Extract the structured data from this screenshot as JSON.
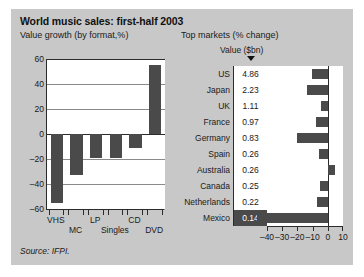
{
  "figure": {
    "title": "World music sales: first-half 2003",
    "subtitle_left": "Value growth (by format,%)",
    "subtitle_right": "Top markets (% change)",
    "value_column_header": "Value ($bn)",
    "sort_marker_icon": "sort-descending-triangle-icon",
    "source": "Source: IFPI."
  },
  "chart_data": [
    {
      "type": "bar",
      "title": "Value growth (by format,%)",
      "xlabel": "",
      "ylabel": "",
      "ylim": [
        -60,
        60
      ],
      "yticks": [
        -60,
        -40,
        -20,
        0,
        20,
        40,
        60
      ],
      "ytick_labels": [
        "–60",
        "–40",
        "–20",
        "0",
        "20",
        "40",
        "60"
      ],
      "grid": true,
      "legend": "none",
      "categories": [
        "VHS",
        "MC",
        "LP",
        "Singles",
        "CD",
        "DVD"
      ],
      "values": [
        -55,
        -33,
        -19,
        -19,
        -11,
        55
      ],
      "bar_color": "#4a4a4a"
    },
    {
      "type": "bar",
      "orientation": "horizontal",
      "title": "Top markets (% change)",
      "xlabel": "",
      "ylabel": "",
      "xlim": [
        -40,
        10
      ],
      "xticks": [
        -40,
        -30,
        -20,
        -10,
        0,
        10
      ],
      "xtick_labels": [
        "–40",
        "–30",
        "–20",
        "–10",
        "0",
        "10"
      ],
      "grid": false,
      "legend": "none",
      "value_column_label": "Value ($bn)",
      "categories": [
        "US",
        "Japan",
        "UK",
        "France",
        "Germany",
        "Spain",
        "Australia",
        "Canada",
        "Netherlands",
        "Mexico"
      ],
      "value_bn": [
        "4.86",
        "2.23",
        "1.11",
        "0.97",
        "0.83",
        "0.26",
        "0.26",
        "0.25",
        "0.22",
        "0.14"
      ],
      "values": [
        -10.5,
        -13.5,
        -4.5,
        -8,
        -20.5,
        -6,
        5,
        -5,
        -7,
        -40
      ],
      "highlighted_row": "Mexico",
      "bar_color": "#4a4a4a"
    }
  ],
  "colors": {
    "figure_background": "#c8c8c8",
    "plot_background": "#ffffff",
    "bar": "#4a4a4a",
    "axis": "#2b2b2b",
    "gridline": "#8a8a8a",
    "text": "#1a1a1a"
  }
}
